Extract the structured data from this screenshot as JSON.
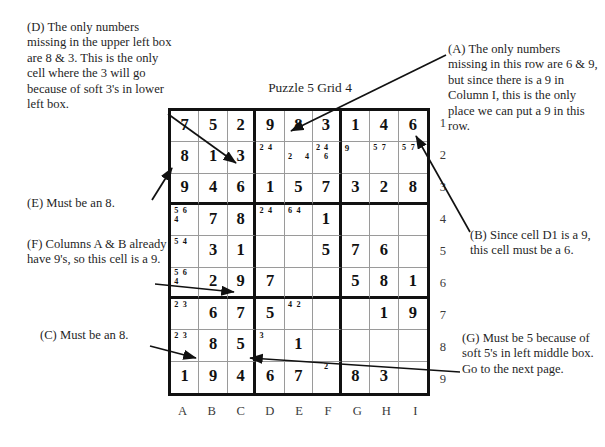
{
  "title": "Puzzle 5  Grid 4",
  "colors": {
    "grid_line": "#9a9a9a",
    "grid_bold": "#111111",
    "text": "#1f1f1f"
  },
  "labels": {
    "columns": [
      "A",
      "B",
      "C",
      "D",
      "E",
      "F",
      "G",
      "H",
      "I"
    ],
    "rows": [
      "1",
      "2",
      "3",
      "4",
      "5",
      "6",
      "7",
      "8",
      "9"
    ]
  },
  "notes": {
    "a": "(A) The only numbers missing in this row are 6 & 9, but since there is a 9 in Column I, this is the only place we can put a 9 in this row.",
    "b": "(B) Since cell D1 is a 9, this cell must be a 6.",
    "c": "(C) Must be an 8.",
    "d": "(D) The only numbers missing in the upper left box are 8 & 3. This is the only cell where the 3 will go because of soft 3's in lower left box.",
    "e": "(E) Must be an 8.",
    "f": "(F) Columns A & B already have 9's, so this cell is a 9.",
    "g": "(G) Must be 5 because of soft 5's in left middle box. Go to the next page."
  },
  "grid": [
    [
      {
        "v": "7"
      },
      {
        "v": "5"
      },
      {
        "v": "2"
      },
      {
        "v": "9"
      },
      {
        "v": "8"
      },
      {
        "v": "3"
      },
      {
        "v": "1"
      },
      {
        "v": "4"
      },
      {
        "v": "6"
      }
    ],
    [
      {
        "v": "8"
      },
      {
        "v": "1"
      },
      {
        "v": "3"
      },
      {
        "p": [
          "2",
          "4",
          "",
          "",
          "",
          "",
          "",
          "",
          ""
        ]
      },
      {
        "p": [
          "",
          "",
          "",
          "2",
          "",
          "4",
          "",
          "",
          ""
        ]
      },
      {
        "p": [
          "2",
          "4",
          "",
          "",
          "6",
          "",
          "",
          "",
          ""
        ]
      },
      {
        "v": "9",
        "small": true
      },
      {
        "p": [
          "5",
          "7",
          "",
          "",
          "",
          "",
          "",
          "",
          ""
        ]
      },
      {
        "p": [
          "5",
          "7",
          "",
          "",
          "",
          "",
          "",
          "",
          ""
        ]
      }
    ],
    [
      {
        "v": "9"
      },
      {
        "v": "4"
      },
      {
        "v": "6"
      },
      {
        "v": "1"
      },
      {
        "v": "5"
      },
      {
        "v": "7"
      },
      {
        "v": "3"
      },
      {
        "v": "2"
      },
      {
        "v": "8"
      }
    ],
    [
      {
        "p": [
          "5",
          "6",
          "",
          "4",
          "",
          "",
          "",
          "",
          ""
        ]
      },
      {
        "v": "7"
      },
      {
        "v": "8"
      },
      {
        "p": [
          "2",
          "4",
          "",
          "",
          "",
          "",
          "",
          "",
          ""
        ]
      },
      {
        "p": [
          "6",
          "4",
          "",
          "",
          "",
          "",
          "",
          "",
          ""
        ]
      },
      {
        "v": "1"
      },
      {
        "v": ""
      },
      {
        "v": ""
      },
      {
        "v": ""
      }
    ],
    [
      {
        "p": [
          "5",
          "4",
          "",
          "",
          "",
          "",
          "",
          "",
          ""
        ]
      },
      {
        "v": "3"
      },
      {
        "v": "1"
      },
      {
        "v": ""
      },
      {
        "v": ""
      },
      {
        "v": "5"
      },
      {
        "v": "7"
      },
      {
        "v": "6"
      },
      {
        "v": ""
      }
    ],
    [
      {
        "p": [
          "5",
          "6",
          "",
          "4",
          "",
          "",
          "",
          "",
          ""
        ]
      },
      {
        "v": "2"
      },
      {
        "v": "9"
      },
      {
        "v": "7"
      },
      {
        "v": ""
      },
      {
        "v": ""
      },
      {
        "v": "5"
      },
      {
        "v": "8"
      },
      {
        "v": "1"
      }
    ],
    [
      {
        "p": [
          "2",
          "3",
          "",
          "",
          "",
          "",
          "",
          "",
          ""
        ]
      },
      {
        "v": "6"
      },
      {
        "v": "7"
      },
      {
        "v": "5"
      },
      {
        "p": [
          "4",
          "2",
          "",
          "",
          "",
          "",
          "",
          "",
          ""
        ]
      },
      {
        "v": ""
      },
      {
        "v": ""
      },
      {
        "v": "1"
      },
      {
        "v": "9"
      }
    ],
    [
      {
        "p": [
          "2",
          "3",
          "",
          "",
          "",
          "",
          "",
          "",
          ""
        ]
      },
      {
        "v": "8"
      },
      {
        "v": "5"
      },
      {
        "p": [
          "3",
          "",
          "",
          "",
          "",
          "",
          "",
          "",
          ""
        ]
      },
      {
        "v": "1"
      },
      {
        "v": ""
      },
      {
        "v": ""
      },
      {
        "v": ""
      },
      {
        "v": ""
      }
    ],
    [
      {
        "v": "1"
      },
      {
        "v": "9"
      },
      {
        "v": "4"
      },
      {
        "v": "6"
      },
      {
        "v": "7"
      },
      {
        "p": [
          "",
          "2",
          "",
          "",
          "",
          "",
          "",
          "",
          ""
        ]
      },
      {
        "v": "8"
      },
      {
        "v": "3"
      },
      {
        "v": ""
      }
    ]
  ]
}
